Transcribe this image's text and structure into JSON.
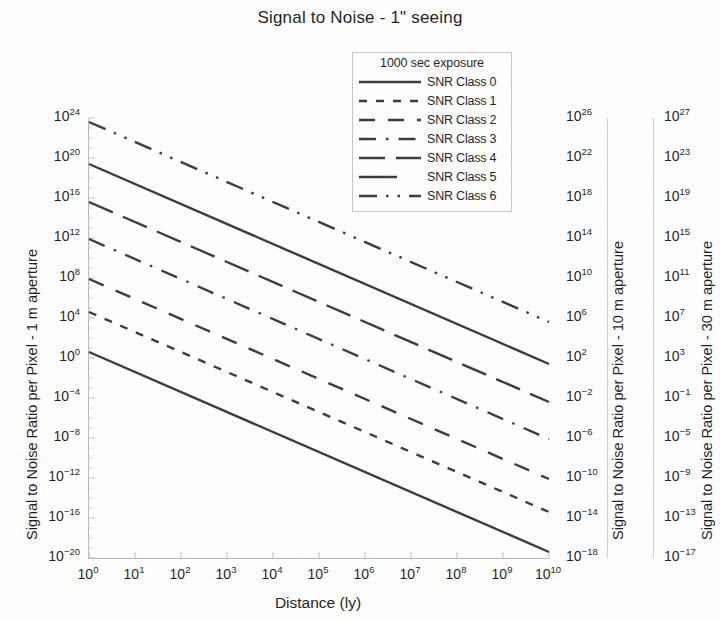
{
  "title": "Signal to Noise - 1\" seeing",
  "legend": {
    "title": "1000 sec exposure",
    "entries": [
      {
        "label": "SNR Class 0",
        "dash": "none"
      },
      {
        "label": "SNR Class 1",
        "dash": "dotted"
      },
      {
        "label": "SNR Class 2",
        "dash": "dashed"
      },
      {
        "label": "SNR Class 3",
        "dash": "dash-dot"
      },
      {
        "label": "SNR Class 4",
        "dash": "long-dash"
      },
      {
        "label": "SNR Class 5",
        "dash": "solid"
      },
      {
        "label": "SNR Class 6",
        "dash": "dash-dot-dot"
      }
    ]
  },
  "axes": {
    "x_title": "Distance (ly)",
    "y_left_title": "Signal to Noise Ratio per Pixel - 1 m aperture",
    "y_mid_title": "Signal to Noise Ratio per Pixel - 10 m aperture",
    "y_right_title": "Signal to Noise Ratio per Pixel - 30 m aperture",
    "x_ticks": [
      "10^0",
      "10^1",
      "10^2",
      "10^3",
      "10^4",
      "10^5",
      "10^6",
      "10^7",
      "10^8",
      "10^9",
      "10^10"
    ],
    "y_left_ticks": [
      "10^24",
      "10^20",
      "10^16",
      "10^12",
      "10^8",
      "10^4",
      "10^0",
      "10^-4",
      "10^-8",
      "10^-12",
      "10^-16",
      "10^-20"
    ],
    "y_mid_ticks": [
      "10^26",
      "10^22",
      "10^18",
      "10^14",
      "10^10",
      "10^6",
      "10^2",
      "10^-2",
      "10^-6",
      "10^-10",
      "10^-14",
      "10^-18"
    ],
    "y_right_ticks": [
      "10^27",
      "10^23",
      "10^19",
      "10^15",
      "10^11",
      "10^7",
      "10^3",
      "10^-1",
      "10^-5",
      "10^-9",
      "10^-13",
      "10^-17"
    ]
  },
  "colors": {
    "line": "#3b3b3b",
    "frame": "#b9b9b9",
    "text": "#1f1f1f",
    "background": "#ffffff"
  },
  "chart_data": {
    "type": "line",
    "title": "Signal to Noise - 1\" seeing",
    "xlabel": "Distance (ly)",
    "ylabel": "Signal to Noise Ratio per Pixel - 1 m aperture",
    "xscale": "log",
    "yscale": "log",
    "xlim_log10": [
      0,
      10
    ],
    "ylim_log10": [
      -20,
      24
    ],
    "grid": false,
    "legend_position": "top-center-inside",
    "legend_title": "1000 sec exposure",
    "note": "All series are straight lines on the log-log axes with slope -2 (inverse-square falloff); values given as log10(SNR) at x = 10^0 ly and x = 10^10 ly.",
    "series": [
      {
        "name": "SNR Class 0",
        "dash": "none",
        "x_log10": [
          0,
          10
        ],
        "y_log10": [
          0.6,
          -19.4
        ]
      },
      {
        "name": "SNR Class 1",
        "dash": "dotted",
        "x_log10": [
          0,
          10
        ],
        "y_log10": [
          4.6,
          -15.4
        ]
      },
      {
        "name": "SNR Class 2",
        "dash": "dashed",
        "x_log10": [
          0,
          10
        ],
        "y_log10": [
          7.9,
          -12.1
        ]
      },
      {
        "name": "SNR Class 3",
        "dash": "dash-dot",
        "x_log10": [
          0,
          10
        ],
        "y_log10": [
          11.9,
          -8.1
        ]
      },
      {
        "name": "SNR Class 4",
        "dash": "long-dash",
        "x_log10": [
          0,
          10
        ],
        "y_log10": [
          15.6,
          -4.4
        ]
      },
      {
        "name": "SNR Class 5",
        "dash": "solid",
        "x_log10": [
          0,
          10
        ],
        "y_log10": [
          19.4,
          -0.6
        ]
      },
      {
        "name": "SNR Class 6",
        "dash": "dash-dot-dot",
        "x_log10": [
          0,
          10
        ],
        "y_log10": [
          23.6,
          3.6
        ]
      }
    ]
  }
}
